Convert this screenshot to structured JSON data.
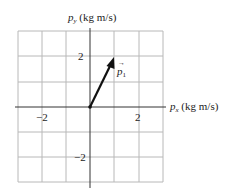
{
  "diagram": {
    "x_axis_label": {
      "symbol": "p",
      "subscript": "x",
      "unit": "(kg m/s)"
    },
    "y_axis_label": {
      "symbol": "p",
      "subscript": "y",
      "unit": "(kg m/s)"
    },
    "x_ticks": [
      {
        "value": -2,
        "label": "−2"
      },
      {
        "value": 2,
        "label": "2"
      }
    ],
    "y_ticks": [
      {
        "value": 2,
        "label": "2"
      },
      {
        "value": -2,
        "label": "−2"
      }
    ],
    "grid": {
      "xmin": -3,
      "xmax": 3,
      "ymin": -3,
      "ymax": 3,
      "step": 1
    },
    "vector": {
      "label": "p",
      "subscript": "1",
      "from": [
        0,
        0
      ],
      "to": [
        1,
        2
      ]
    },
    "colors": {
      "grid": "#b0b0b0",
      "axis": "#222222",
      "vector": "#111111"
    }
  }
}
